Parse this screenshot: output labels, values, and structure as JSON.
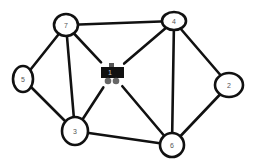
{
  "diagram": {
    "type": "undirected-graph",
    "background": "#ffffff",
    "stroke_color": "#111111",
    "nodes": [
      {
        "id": "7",
        "label": "7",
        "cx": 66,
        "cy": 25,
        "rx": 12,
        "ry": 11
      },
      {
        "id": "4",
        "label": "4",
        "cx": 174,
        "cy": 21,
        "rx": 12,
        "ry": 9
      },
      {
        "id": "5",
        "label": "5",
        "cx": 23,
        "cy": 79,
        "rx": 10,
        "ry": 13
      },
      {
        "id": "2",
        "label": "2",
        "cx": 229,
        "cy": 85,
        "rx": 14,
        "ry": 12
      },
      {
        "id": "3",
        "label": "3",
        "cx": 75,
        "cy": 131,
        "rx": 13,
        "ry": 14
      },
      {
        "id": "6",
        "label": "6",
        "cx": 172,
        "cy": 145,
        "rx": 12,
        "ry": 12
      }
    ],
    "robot_node": {
      "id": "1",
      "label": "1",
      "icon": "robot-vehicle-icon",
      "cx": 112,
      "cy": 74
    },
    "edges": [
      [
        "7",
        "4"
      ],
      [
        "7",
        "5"
      ],
      [
        "7",
        "3"
      ],
      [
        "7",
        "1"
      ],
      [
        "4",
        "1"
      ],
      [
        "4",
        "6"
      ],
      [
        "4",
        "2"
      ],
      [
        "5",
        "3"
      ],
      [
        "3",
        "1"
      ],
      [
        "3",
        "6"
      ],
      [
        "1",
        "6"
      ],
      [
        "2",
        "6"
      ]
    ]
  }
}
